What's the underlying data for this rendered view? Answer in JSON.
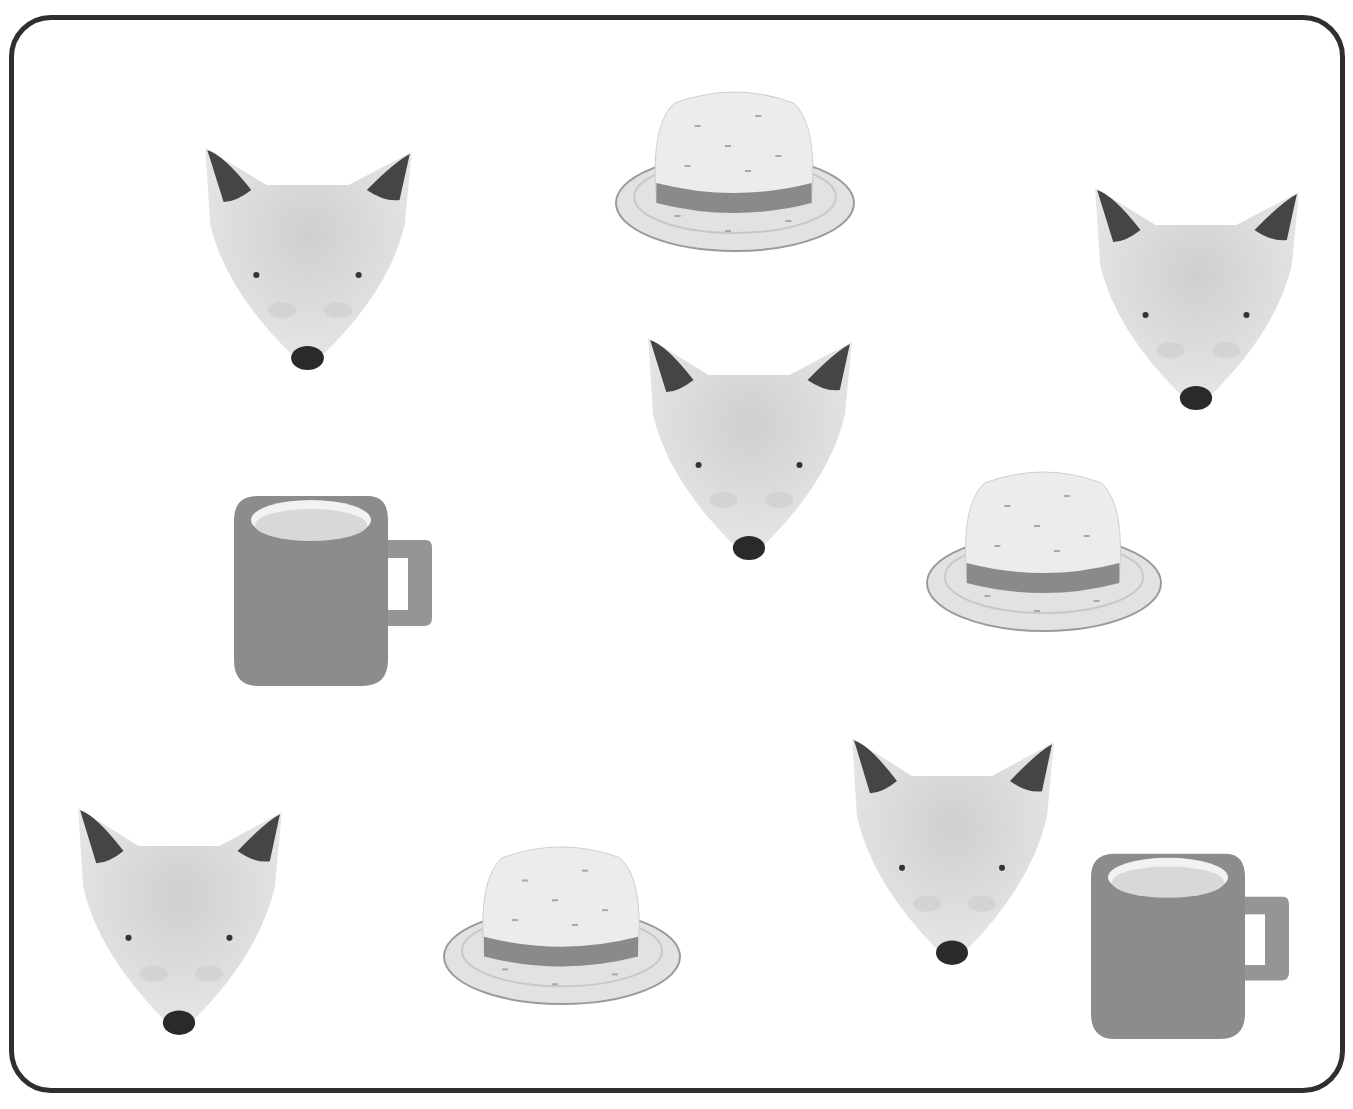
{
  "worksheet": {
    "title": "",
    "frame": {
      "border_color": "#2f2f2f",
      "background": "#ffffff"
    },
    "colors": {
      "fox_face": "#dcdcdc",
      "fox_ear": "#444444",
      "fox_nose": "#2a2a2a",
      "hat_crown": "#ececec",
      "hat_band": "#8a8a8a",
      "hat_brim": "#e2e2e2",
      "mug_body": "#8c8c8c",
      "mug_inner": "#d8d8d8"
    },
    "counts": {
      "fox": 5,
      "hat": 3,
      "mug": 2
    },
    "items": [
      {
        "type": "fox",
        "x": 195,
        "y": 140,
        "w": 225,
        "h": 235
      },
      {
        "type": "hat",
        "x": 614,
        "y": 85,
        "w": 242,
        "h": 170
      },
      {
        "type": "fox",
        "x": 1085,
        "y": 180,
        "w": 222,
        "h": 235
      },
      {
        "type": "fox",
        "x": 638,
        "y": 330,
        "w": 222,
        "h": 235
      },
      {
        "type": "mug",
        "x": 228,
        "y": 490,
        "w": 205,
        "h": 200
      },
      {
        "type": "hat",
        "x": 925,
        "y": 465,
        "w": 238,
        "h": 170
      },
      {
        "type": "fox",
        "x": 68,
        "y": 800,
        "w": 222,
        "h": 240
      },
      {
        "type": "hat",
        "x": 442,
        "y": 840,
        "w": 240,
        "h": 168
      },
      {
        "type": "fox",
        "x": 842,
        "y": 730,
        "w": 220,
        "h": 240
      },
      {
        "type": "mug",
        "x": 1085,
        "y": 848,
        "w": 205,
        "h": 195
      }
    ]
  }
}
